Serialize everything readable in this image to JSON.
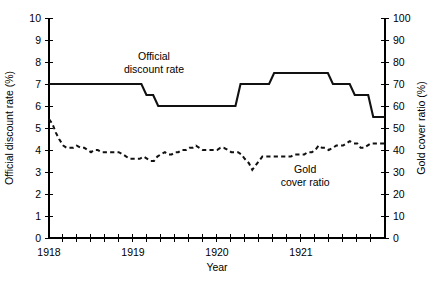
{
  "chart_data": {
    "type": "line",
    "title": "",
    "xlabel": "Year",
    "ylabel": "Official discount rate (%)",
    "y2label": "Gold cover ratio (%)",
    "xlim": [
      1918.0,
      1922.0
    ],
    "ylim": [
      0,
      10
    ],
    "y2lim": [
      0,
      100
    ],
    "grid": false,
    "legend_position": "inline-annotations",
    "x_tick_labels": [
      "1918",
      "1919",
      "1920",
      "1921"
    ],
    "x_tick_label_values": [
      1918,
      1919,
      1920,
      1921
    ],
    "x_minor_tick_interval_years": 0.16666,
    "y_tick_labels": [
      "0",
      "1",
      "2",
      "3",
      "4",
      "5",
      "6",
      "7",
      "8",
      "9",
      "10"
    ],
    "y_tick_values": [
      0,
      1,
      2,
      3,
      4,
      5,
      6,
      7,
      8,
      9,
      10
    ],
    "y2_tick_labels": [
      "0",
      "10",
      "20",
      "30",
      "40",
      "50",
      "60",
      "70",
      "80",
      "90",
      "100"
    ],
    "y2_tick_values": [
      0,
      10,
      20,
      30,
      40,
      50,
      60,
      70,
      80,
      90,
      100
    ],
    "annotations": [
      {
        "text_line1": "Official",
        "text_line2": "discount rate",
        "x": 1919.25,
        "y": 8.1
      },
      {
        "text_line1": "Gold",
        "text_line2": "cover ratio",
        "x": 1921.05,
        "y": 2.95
      }
    ],
    "series": [
      {
        "name": "Official discount rate",
        "axis": "left",
        "style": "step-solid",
        "units": "%",
        "x": [
          1918.0,
          1919.1,
          1919.16,
          1919.24,
          1919.3,
          1920.22,
          1920.28,
          1920.62,
          1920.68,
          1921.32,
          1921.38,
          1921.58,
          1921.64,
          1921.8,
          1921.86,
          1922.0
        ],
        "values": [
          7.0,
          7.0,
          6.5,
          6.5,
          6.0,
          6.0,
          7.0,
          7.0,
          7.5,
          7.5,
          7.0,
          7.0,
          6.5,
          6.5,
          5.5,
          5.5
        ]
      },
      {
        "name": "Gold cover ratio",
        "axis": "right",
        "style": "dashed",
        "units": "%",
        "x": [
          1918.0,
          1918.04,
          1918.08,
          1918.12,
          1918.17,
          1918.21,
          1918.25,
          1918.29,
          1918.33,
          1918.38,
          1918.42,
          1918.46,
          1918.5,
          1918.54,
          1918.58,
          1918.63,
          1918.67,
          1918.71,
          1918.75,
          1918.79,
          1918.83,
          1918.88,
          1918.92,
          1918.96,
          1919.0,
          1919.04,
          1919.08,
          1919.13,
          1919.17,
          1919.21,
          1919.25,
          1919.29,
          1919.33,
          1919.38,
          1919.42,
          1919.46,
          1919.5,
          1919.54,
          1919.58,
          1919.63,
          1919.67,
          1919.71,
          1919.75,
          1919.79,
          1919.83,
          1919.88,
          1919.92,
          1919.96,
          1920.0,
          1920.04,
          1920.08,
          1920.13,
          1920.17,
          1920.21,
          1920.25,
          1920.29,
          1920.33,
          1920.38,
          1920.42,
          1920.46,
          1920.5,
          1920.54,
          1920.58,
          1920.63,
          1920.67,
          1920.71,
          1920.75,
          1920.79,
          1920.83,
          1920.88,
          1920.92,
          1920.96,
          1921.0,
          1921.04,
          1921.08,
          1921.13,
          1921.17,
          1921.21,
          1921.25,
          1921.29,
          1921.33,
          1921.38,
          1921.42,
          1921.46,
          1921.5,
          1921.54,
          1921.58,
          1921.63,
          1921.67,
          1921.71,
          1921.75,
          1921.79,
          1921.83,
          1921.88,
          1921.92,
          1921.96,
          1922.0
        ],
        "values": [
          54,
          52,
          48,
          45,
          42,
          41,
          41,
          41,
          42,
          41,
          41,
          40,
          39,
          40,
          40,
          39,
          39,
          39,
          39,
          39,
          39,
          38,
          37,
          36,
          36,
          36,
          36,
          37,
          36,
          35,
          35,
          37,
          38,
          39,
          38,
          38,
          39,
          39,
          40,
          40,
          41,
          41,
          42,
          41,
          40,
          40,
          40,
          40,
          40,
          41,
          41,
          40,
          39,
          39,
          39,
          38,
          36,
          34,
          31,
          33,
          35,
          37,
          37,
          37,
          37,
          37,
          37,
          37,
          37,
          37,
          38,
          38,
          38,
          38,
          39,
          39,
          40,
          42,
          41,
          41,
          40,
          41,
          42,
          42,
          42,
          43,
          44,
          43,
          43,
          41,
          41,
          42,
          43,
          43,
          43,
          43,
          43
        ]
      }
    ]
  },
  "layout": {
    "plot_left_px": 49,
    "plot_right_px": 385,
    "plot_top_px": 18,
    "plot_bottom_px": 238
  }
}
